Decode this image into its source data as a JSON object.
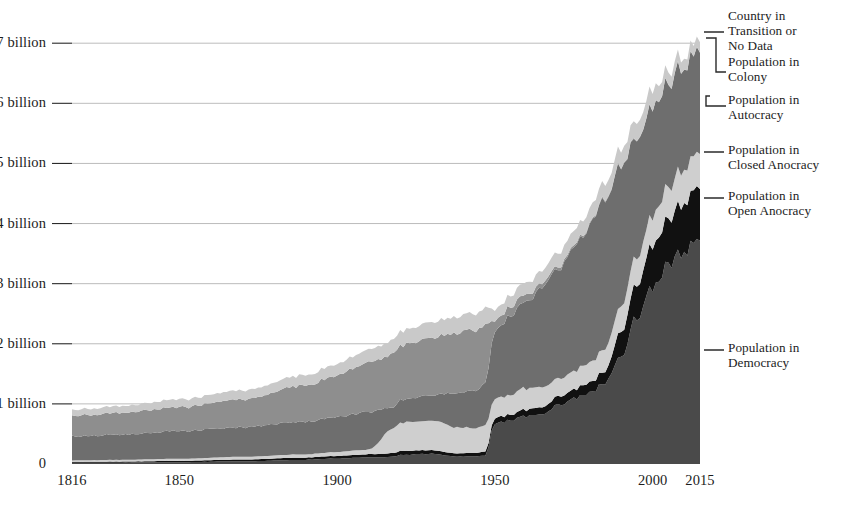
{
  "chart_data": {
    "type": "area",
    "stacked": true,
    "title": "",
    "subtitle": "",
    "xlabel": "",
    "ylabel": "",
    "xlim": [
      1816,
      2015
    ],
    "ylim": [
      0,
      7400000000
    ],
    "grid": true,
    "legend_position": "right",
    "y_tick_labels": [
      "0",
      "1 billion",
      "2 billion",
      "3 billion",
      "4 billion",
      "5 billion",
      "6 billion",
      "7 billion"
    ],
    "y_tick_values": [
      0,
      1000000000,
      2000000000,
      3000000000,
      4000000000,
      5000000000,
      6000000000,
      7000000000
    ],
    "x_tick_labels": [
      "1816",
      "1850",
      "1900",
      "1950",
      "2000",
      "2015"
    ],
    "x_tick_values": [
      1816,
      1850,
      1900,
      1950,
      2000,
      2015
    ],
    "series_order_bottom_to_top": [
      "Population in Democracy",
      "Population in Open Anocracy",
      "Population in Closed Anocracy",
      "Population in Autocracy",
      "Population in Colony",
      "Country in Transition or No Data"
    ],
    "series": [
      {
        "name": "Population in Democracy",
        "color": "#4a4a4a",
        "x": [
          1816,
          1830,
          1850,
          1870,
          1890,
          1900,
          1910,
          1918,
          1920,
          1930,
          1938,
          1945,
          1947,
          1950,
          1955,
          1960,
          1965,
          1970,
          1975,
          1980,
          1985,
          1990,
          1995,
          2000,
          2005,
          2010,
          2015
        ],
        "values": [
          20000000,
          22000000,
          30000000,
          45000000,
          70000000,
          90000000,
          110000000,
          120000000,
          150000000,
          170000000,
          120000000,
          130000000,
          140000000,
          680000000,
          720000000,
          790000000,
          850000000,
          980000000,
          1080000000,
          1180000000,
          1350000000,
          1800000000,
          2450000000,
          2950000000,
          3300000000,
          3550000000,
          3780000000
        ]
      },
      {
        "name": "Population in Open Anocracy",
        "color": "#111111",
        "x": [
          1816,
          1830,
          1850,
          1870,
          1890,
          1900,
          1910,
          1918,
          1920,
          1930,
          1938,
          1945,
          1947,
          1950,
          1955,
          1960,
          1965,
          1970,
          1975,
          1980,
          1985,
          1990,
          1995,
          2000,
          2005,
          2010,
          2015
        ],
        "values": [
          15000000,
          18000000,
          22000000,
          30000000,
          38000000,
          45000000,
          50000000,
          60000000,
          65000000,
          60000000,
          55000000,
          60000000,
          70000000,
          90000000,
          95000000,
          110000000,
          120000000,
          140000000,
          150000000,
          170000000,
          200000000,
          420000000,
          560000000,
          700000000,
          760000000,
          820000000,
          880000000
        ]
      },
      {
        "name": "Population in Closed Anocracy",
        "color": "#cfcfcf",
        "x": [
          1816,
          1830,
          1850,
          1870,
          1890,
          1900,
          1910,
          1918,
          1920,
          1930,
          1938,
          1945,
          1947,
          1950,
          1955,
          1960,
          1965,
          1970,
          1975,
          1980,
          1985,
          1990,
          1995,
          2000,
          2005,
          2010,
          2015
        ],
        "values": [
          25000000,
          28000000,
          35000000,
          45000000,
          55000000,
          65000000,
          80000000,
          420000000,
          470000000,
          500000000,
          430000000,
          420000000,
          450000000,
          320000000,
          330000000,
          360000000,
          330000000,
          300000000,
          310000000,
          330000000,
          370000000,
          420000000,
          470000000,
          500000000,
          530000000,
          560000000,
          590000000
        ]
      },
      {
        "name": "Population in Autocracy",
        "color": "#6e6e6e",
        "x": [
          1816,
          1830,
          1850,
          1870,
          1890,
          1900,
          1910,
          1918,
          1920,
          1930,
          1938,
          1945,
          1947,
          1950,
          1955,
          1960,
          1965,
          1970,
          1975,
          1980,
          1985,
          1990,
          1995,
          2000,
          2005,
          2010,
          2015
        ],
        "values": [
          400000000,
          420000000,
          460000000,
          490000000,
          540000000,
          580000000,
          620000000,
          350000000,
          380000000,
          420000000,
          560000000,
          640000000,
          700000000,
          1150000000,
          1300000000,
          1450000000,
          1620000000,
          1830000000,
          2050000000,
          2270000000,
          2490000000,
          2330000000,
          1990000000,
          1800000000,
          1720000000,
          1700000000,
          1720000000
        ]
      },
      {
        "name": "Population in Colony",
        "color": "#8e8e8e",
        "x": [
          1816,
          1830,
          1850,
          1870,
          1890,
          1900,
          1910,
          1918,
          1920,
          1930,
          1938,
          1945,
          1947,
          1950,
          1955,
          1960,
          1965,
          1970,
          1975,
          1980,
          1985,
          1990,
          1995,
          2000,
          2005,
          2010,
          2015
        ],
        "values": [
          340000000,
          360000000,
          400000000,
          470000000,
          600000000,
          700000000,
          820000000,
          880000000,
          900000000,
          960000000,
          1010000000,
          1000000000,
          960000000,
          180000000,
          150000000,
          110000000,
          70000000,
          45000000,
          30000000,
          20000000,
          15000000,
          12000000,
          10000000,
          8000000,
          7000000,
          6000000,
          5000000
        ]
      },
      {
        "name": "Country in Transition or No Data",
        "color": "#c9c9c9",
        "x": [
          1816,
          1830,
          1850,
          1870,
          1890,
          1900,
          1910,
          1918,
          1920,
          1930,
          1938,
          1945,
          1947,
          1950,
          1955,
          1960,
          1965,
          1970,
          1975,
          1980,
          1985,
          1990,
          1995,
          2000,
          2005,
          2010,
          2015
        ],
        "values": [
          100000000,
          110000000,
          130000000,
          150000000,
          170000000,
          190000000,
          210000000,
          230000000,
          240000000,
          260000000,
          270000000,
          280000000,
          290000000,
          180000000,
          190000000,
          200000000,
          210000000,
          230000000,
          240000000,
          250000000,
          260000000,
          270000000,
          280000000,
          290000000,
          200000000,
          180000000,
          170000000
        ]
      }
    ],
    "legend_entries": [
      {
        "label": "Country in\nTransition or\nNo Data",
        "color": "#c9c9c9"
      },
      {
        "label": "Population in\nColony",
        "color": "#8e8e8e"
      },
      {
        "label": "Population in\nAutocracy",
        "color": "#6e6e6e"
      },
      {
        "label": "Population in\nClosed Anocracy",
        "color": "#cfcfcf"
      },
      {
        "label": "Population in\nOpen Anocracy",
        "color": "#111111"
      },
      {
        "label": "Population in\nDemocracy",
        "color": "#4a4a4a"
      }
    ]
  },
  "axis": {
    "y_ticks": [
      {
        "label": "7 billion",
        "value": 7000000000
      },
      {
        "label": "6 billion",
        "value": 6000000000
      },
      {
        "label": "5 billion",
        "value": 5000000000
      },
      {
        "label": "4 billion",
        "value": 4000000000
      },
      {
        "label": "3 billion",
        "value": 3000000000
      },
      {
        "label": "2 billion",
        "value": 2000000000
      },
      {
        "label": "1 billion",
        "value": 1000000000
      },
      {
        "label": "0",
        "value": 0
      }
    ],
    "x_ticks": [
      {
        "label": "1816",
        "value": 1816
      },
      {
        "label": "1850",
        "value": 1850
      },
      {
        "label": "1900",
        "value": 1900
      },
      {
        "label": "1950",
        "value": 1950
      },
      {
        "label": "2000",
        "value": 2000
      },
      {
        "label": "2015",
        "value": 2015
      }
    ]
  },
  "colors": {
    "gridline": "#b4b4b4",
    "leader": "#2a2a2a",
    "text": "#1c1c1c",
    "background": "#ffffff"
  }
}
